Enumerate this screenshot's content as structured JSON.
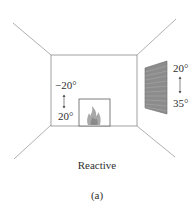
{
  "diagram": {
    "title": "Reactive",
    "subfigure_label": "(a)",
    "room": {
      "back_wall": {
        "x1": 51,
        "y1": 55,
        "x2": 137,
        "y2": 126
      },
      "perspective_lines": [
        {
          "from": [
            13,
            23
          ],
          "to": [
            51,
            55
          ]
        },
        {
          "from": [
            176,
            19
          ],
          "to": [
            137,
            55
          ]
        },
        {
          "from": [
            14,
            159
          ],
          "to": [
            51,
            125
          ]
        },
        {
          "from": [
            175,
            157
          ],
          "to": [
            137,
            126
          ]
        }
      ]
    },
    "fireplace": {
      "label": "fireplace",
      "temp_range": {
        "top": "−20°",
        "bottom": "20°"
      }
    },
    "window": {
      "label": "window",
      "temp_range": {
        "top": "20°",
        "bottom": "35°"
      }
    },
    "colors": {
      "line": "#8a8a8a",
      "window_fill": "#8c8c8c",
      "flame": "#9a9a9a",
      "text": "#2f2f2f"
    }
  }
}
